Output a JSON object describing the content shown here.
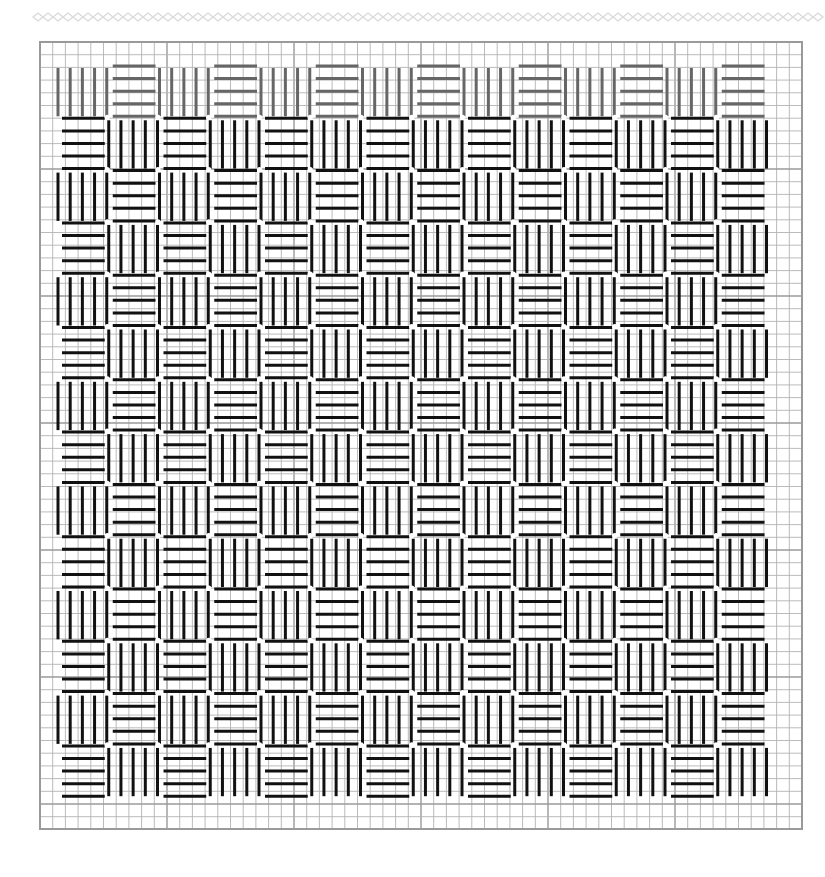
{
  "diagram": {
    "type": "basketweave-stitch-chart",
    "decoration": {
      "name": "diamond-chain-border",
      "x_start": 33,
      "x_end": 825,
      "y_center": 17,
      "diamond_width": 10,
      "diamond_height": 8,
      "color": "#d9d9d9"
    },
    "grid": {
      "left": 40,
      "top": 42,
      "right": 802,
      "bottom": 829,
      "cell_size_x": 12.7,
      "cell_size_y": 12.7,
      "major_every": 10,
      "minor_color": "#b3b3b3",
      "major_color": "#9a9a9a",
      "border_color": "#9a9a9a"
    },
    "weave": {
      "rows": 14,
      "cols": 14,
      "origin_x": 58,
      "origin_y": 65,
      "pitch_x": 50.75,
      "pitch_y": 52.3,
      "lines_per_block": 5,
      "rule": "block (r,c) is vertical when (r+c) is even, horizontal when odd",
      "first_row_color": "#666666",
      "stroke_color": "#111111",
      "stroke_width": 3,
      "junction_dot_color": "#ffffff"
    }
  }
}
